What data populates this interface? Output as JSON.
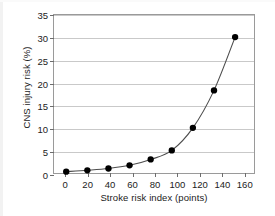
{
  "chart_data": {
    "type": "line",
    "title": "",
    "xlabel": "Stroke risk index (points)",
    "ylabel": "CNS injury risk (%)",
    "xlim": [
      -10,
      170
    ],
    "ylim": [
      0,
      35
    ],
    "xticks": [
      0,
      20,
      40,
      60,
      80,
      100,
      120,
      140,
      160
    ],
    "xtick_labels": [
      "0",
      "20",
      "40",
      "60",
      "80",
      "100",
      "120",
      "140",
      "160"
    ],
    "yticks": [
      0,
      5,
      10,
      15,
      20,
      25,
      30,
      35
    ],
    "ytick_labels": [
      "0",
      "5",
      "10",
      "15",
      "20",
      "25",
      "30",
      "35"
    ],
    "grid": "horizontal",
    "legend": "none",
    "marker": "filled-circle",
    "series": [
      {
        "name": "CNS injury risk",
        "x": [
          1,
          20,
          39,
          58,
          77,
          96,
          115,
          134,
          153
        ],
        "y": [
          0.3,
          0.6,
          1.0,
          1.7,
          3.0,
          5.0,
          10.0,
          18.3,
          30.1
        ]
      }
    ],
    "colors": {
      "marker": "#000000",
      "line": "#4d4d4d",
      "grid": "#c9c9c9",
      "frame": "#9a9a9a",
      "background": "#ffffff"
    }
  }
}
